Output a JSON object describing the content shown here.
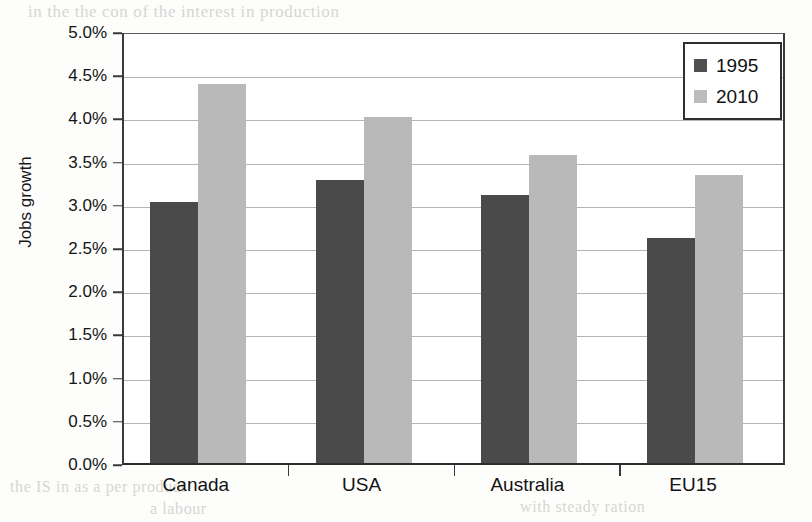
{
  "chart_data": {
    "type": "bar",
    "title": "",
    "xlabel": "",
    "ylabel": "Jobs growth",
    "categories": [
      "Canada",
      "USA",
      "Australia",
      "EU15"
    ],
    "series": [
      {
        "name": "1995",
        "color": "#4a4a4a",
        "values": [
          3.02,
          3.28,
          3.1,
          2.6
        ]
      },
      {
        "name": "2010",
        "color": "#b9b9b9",
        "values": [
          4.39,
          4.0,
          3.56,
          3.33
        ]
      }
    ],
    "ylim": [
      0.0,
      5.0
    ],
    "ytick_values": [
      0.0,
      0.5,
      1.0,
      1.5,
      2.0,
      2.5,
      3.0,
      3.5,
      4.0,
      4.5,
      5.0
    ],
    "ytick_labels": [
      "0.0%",
      "0.5%",
      "1.0%",
      "1.5%",
      "2.0%",
      "2.5%",
      "3.0%",
      "3.5%",
      "4.0%",
      "4.5%",
      "5.0%"
    ],
    "value_format": "percent",
    "grid": true,
    "grid_axis": "y",
    "legend_position": "top-right",
    "legend_entries": [
      "1995",
      "2010"
    ],
    "annotations": []
  },
  "page_artifacts": {
    "bleed_text": [
      "in the the con of the interest in production",
      "in the one",
      "and price the in",
      "the tion",
      "en production",
      "in the",
      "the of in a more",
      "an the",
      "the of in tion",
      "the IS in as a per product",
      "a labour",
      "with steady ration"
    ]
  }
}
